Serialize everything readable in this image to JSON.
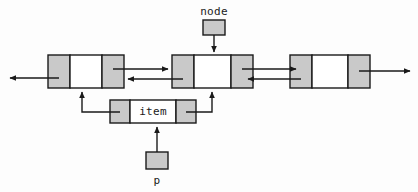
{
  "diagram": {
    "kind": "doubly-linked-list-insertion",
    "canvas": {
      "width": 418,
      "height": 192
    },
    "colors": {
      "pointer_cell_fill": "#c9c9c9",
      "data_cell_fill": "#ffffff",
      "stroke": "#1a1a1a",
      "background": "#fdfdfd",
      "text": "#1a1a1a"
    },
    "labels": {
      "node_pointer": "node",
      "item_data": "item",
      "p_pointer": "p"
    },
    "list_nodes": [
      {
        "id": "node-left",
        "name": "list-node-left",
        "x": 48,
        "y": 55,
        "width": 76,
        "height": 33,
        "prev_cell_width": 22,
        "next_cell_width": 22,
        "data_text": ""
      },
      {
        "id": "node-middle",
        "name": "list-node-middle",
        "x": 172,
        "y": 55,
        "width": 81,
        "height": 33,
        "prev_cell_width": 22,
        "next_cell_width": 22,
        "data_text": ""
      },
      {
        "id": "node-right",
        "name": "list-node-right",
        "x": 290,
        "y": 55,
        "width": 80,
        "height": 33,
        "prev_cell_width": 22,
        "next_cell_width": 22,
        "data_text": ""
      }
    ],
    "item_node": {
      "id": "node-item",
      "name": "list-node-item",
      "x": 110,
      "y": 100,
      "width": 86,
      "height": 23,
      "prev_cell_width": 20,
      "next_cell_width": 20,
      "data_text": "item"
    },
    "pointer_boxes": [
      {
        "id": "ptr-node",
        "name": "pointer-box-node",
        "label": "node",
        "x": 203,
        "y": 20,
        "width": 22,
        "height": 15,
        "label_x": 214,
        "label_y": 6,
        "label_position": "above"
      },
      {
        "id": "ptr-p",
        "name": "pointer-box-p",
        "label": "p",
        "x": 146,
        "y": 152,
        "width": 22,
        "height": 17,
        "label_x": 157,
        "label_y": 175,
        "label_position": "below"
      }
    ],
    "connections": [
      {
        "id": "c1",
        "name": "arrow-left-tail-out",
        "from": "node-left.prev",
        "to": "off-canvas-left",
        "direction": "left"
      },
      {
        "id": "c2",
        "name": "arrow-left-next-to-middle",
        "from": "node-left.next",
        "to": "node-middle",
        "direction": "right"
      },
      {
        "id": "c3",
        "name": "arrow-middle-prev-to-left",
        "from": "node-middle.prev",
        "to": "node-left",
        "direction": "left"
      },
      {
        "id": "c4",
        "name": "arrow-middle-next-to-right",
        "from": "node-middle.next",
        "to": "node-right",
        "direction": "right"
      },
      {
        "id": "c5",
        "name": "arrow-right-prev-to-middle",
        "from": "node-right.prev",
        "to": "node-middle",
        "direction": "left"
      },
      {
        "id": "c6",
        "name": "arrow-right-next-out",
        "from": "node-right.next",
        "to": "off-canvas-right",
        "direction": "right"
      },
      {
        "id": "c7",
        "name": "arrow-node-pointer-to-middle",
        "from": "ptr-node",
        "to": "node-middle",
        "direction": "down"
      },
      {
        "id": "c8",
        "name": "arrow-p-pointer-to-item",
        "from": "ptr-p",
        "to": "node-item",
        "direction": "up"
      },
      {
        "id": "c9",
        "name": "arrow-item-prev-to-left-node",
        "from": "node-item.prev",
        "to": "node-left",
        "direction": "up-left"
      },
      {
        "id": "c10",
        "name": "arrow-item-next-to-middle-node",
        "from": "node-item.next",
        "to": "node-middle",
        "direction": "up-right"
      }
    ]
  }
}
